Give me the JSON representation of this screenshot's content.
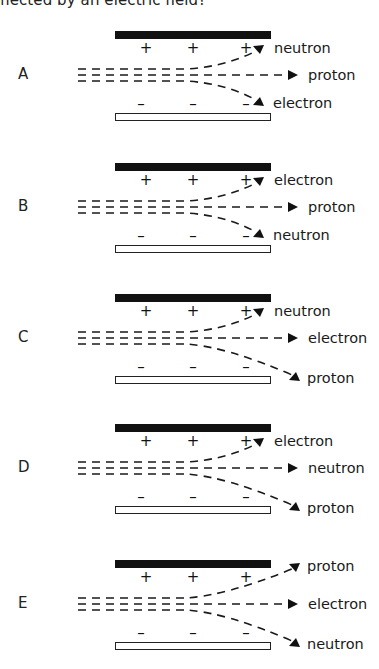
{
  "header": {
    "text": "flected by an electric field?"
  },
  "panels": [
    {
      "letter": "A",
      "top": 0,
      "labels": {
        "upper": "neutron",
        "middle": "proton",
        "lower": "electron"
      },
      "lower_wide": false,
      "upper_wide": false
    },
    {
      "letter": "B",
      "top": 132,
      "labels": {
        "upper": "electron",
        "middle": "proton",
        "lower": "neutron"
      },
      "lower_wide": false,
      "upper_wide": false
    },
    {
      "letter": "C",
      "top": 263,
      "labels": {
        "upper": "neutron",
        "middle": "electron",
        "lower": "proton"
      },
      "lower_wide": true,
      "upper_wide": false
    },
    {
      "letter": "D",
      "top": 393,
      "labels": {
        "upper": "electron",
        "middle": "neutron",
        "lower": "proton"
      },
      "lower_wide": true,
      "upper_wide": false
    },
    {
      "letter": "E",
      "top": 529,
      "labels": {
        "upper": "proton",
        "middle": "electron",
        "lower": "neutron"
      },
      "lower_wide": true,
      "upper_wide": true
    }
  ],
  "charges": {
    "positive": "+",
    "negative": "–"
  },
  "colors": {
    "plate_positive": "#111111",
    "plate_negative": "#ffffff",
    "ink": "#1a1a1a"
  }
}
